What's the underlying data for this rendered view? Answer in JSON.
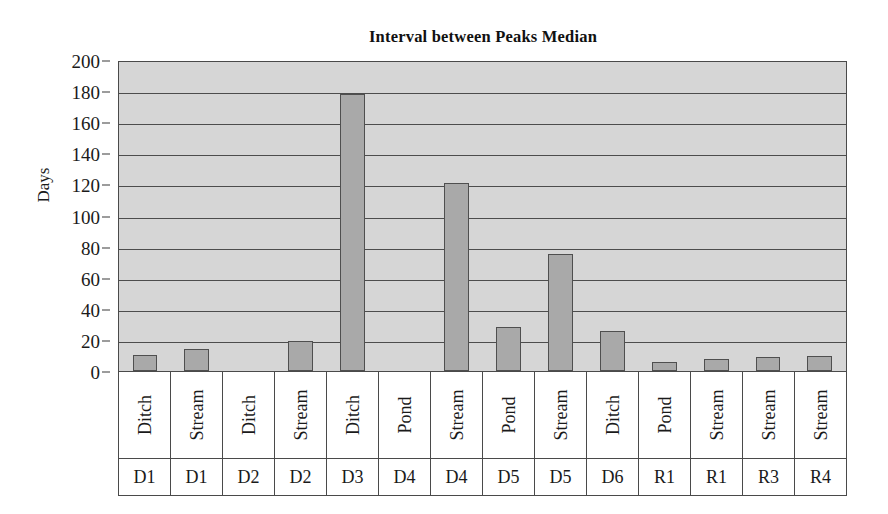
{
  "chart_data": {
    "type": "bar",
    "title": "Interval between Peaks Median",
    "xlabel": "",
    "ylabel": "Days",
    "ylim": [
      0,
      200
    ],
    "ytick_step": 20,
    "yticks": [
      0,
      20,
      40,
      60,
      80,
      100,
      120,
      140,
      160,
      180,
      200
    ],
    "grid": true,
    "legend": "none",
    "categories": [
      "Ditch D1",
      "Stream D1",
      "Ditch D2",
      "Stream D2",
      "Ditch D3",
      "Pond D4",
      "Stream D4",
      "Pond D5",
      "Stream D5",
      "Ditch D6",
      "Pond R1",
      "Stream R1",
      "Stream R3",
      "Stream R4"
    ],
    "habitat_labels": [
      "Ditch",
      "Stream",
      "Ditch",
      "Stream",
      "Ditch",
      "Pond",
      "Stream",
      "Pond",
      "Stream",
      "Ditch",
      "Pond",
      "Stream",
      "Stream",
      "Stream"
    ],
    "site_labels": [
      "D1",
      "D1",
      "D2",
      "D2",
      "D3",
      "D4",
      "D4",
      "D5",
      "D5",
      "D6",
      "R1",
      "R1",
      "R3",
      "R4"
    ],
    "values": [
      10,
      14,
      0,
      19,
      178,
      0,
      121,
      28,
      75,
      26,
      6,
      8,
      9,
      9.5
    ],
    "colors": {
      "bar_fill": "#a9a9a9",
      "bar_border": "#4f4f4f",
      "plot_background": "#d6d6d6",
      "gridline": "#4d4d4d",
      "axis": "#4a4a4a",
      "text": "#1a1a1a"
    }
  }
}
